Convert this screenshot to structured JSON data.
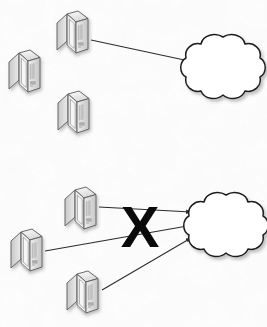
{
  "figure": {
    "name": "network-connectivity-diagram",
    "type": "diagram",
    "width": 267,
    "height": 327,
    "background_color": "#fdfdfd",
    "style": "scanned-paper-grayscale-isometric-clipart"
  },
  "palette": {
    "line": "#2b2b2b",
    "x_mark": "#0a0a0a",
    "node_outline": "#4a4a4a",
    "node_face_light": "#fbfbfb",
    "node_face_mid": "#e8e8e8",
    "node_face_dark": "#cfcfcf",
    "shadow": "#b4b4b4",
    "cloud_fill": "#ffffff",
    "cloud_outline": "#1e1e1e"
  },
  "panels": [
    {
      "id": "top-panel",
      "name": "single-connection-panel",
      "label": "",
      "nodes": [
        {
          "id": "top-server-1",
          "name": "server-node",
          "icon": "server-isometric-icon",
          "label": "",
          "x": 70,
          "y": 36,
          "connected": true
        },
        {
          "id": "top-server-2",
          "name": "server-node",
          "icon": "server-isometric-icon",
          "label": "",
          "x": 22,
          "y": 73,
          "connected": false
        },
        {
          "id": "top-server-3",
          "name": "server-node",
          "icon": "server-isometric-icon",
          "label": "",
          "x": 71,
          "y": 114,
          "connected": false
        }
      ],
      "cloud": {
        "id": "top-cloud",
        "name": "network-cloud",
        "label": "",
        "cx": 223,
        "cy": 66,
        "rx": 39,
        "ry": 35
      },
      "connections": [
        {
          "id": "top-link-1",
          "name": "connection-arrow",
          "from": "top-server-1",
          "to": "top-cloud",
          "x1": 91,
          "y1": 40,
          "x2": 189,
          "y2": 61,
          "arrowhead": true,
          "blocked": false
        }
      ],
      "blocked_marker": null
    },
    {
      "id": "bottom-panel",
      "name": "multi-connection-blocked-panel",
      "label": "",
      "nodes": [
        {
          "id": "bottom-server-1",
          "name": "server-node",
          "icon": "server-isometric-icon",
          "label": "",
          "x": 78,
          "y": 196,
          "connected": true
        },
        {
          "id": "bottom-server-2",
          "name": "server-node",
          "icon": "server-isometric-icon",
          "label": "",
          "x": 24,
          "y": 238,
          "connected": true
        },
        {
          "id": "bottom-server-3",
          "name": "server-node",
          "icon": "server-isometric-icon",
          "label": "",
          "x": 80,
          "y": 280,
          "connected": true
        }
      ],
      "cloud": {
        "id": "bottom-cloud",
        "name": "network-cloud",
        "label": "",
        "cx": 226,
        "cy": 224,
        "rx": 39,
        "ry": 35
      },
      "connections": [
        {
          "id": "bottom-link-1",
          "name": "connection-arrow",
          "from": "bottom-server-1",
          "to": "bottom-cloud",
          "x1": 99,
          "y1": 207,
          "x2": 191,
          "y2": 212,
          "arrowhead": true,
          "blocked": true
        },
        {
          "id": "bottom-link-2",
          "name": "connection-arrow",
          "from": "bottom-server-2",
          "to": "bottom-cloud",
          "x1": 45,
          "y1": 251,
          "x2": 193,
          "y2": 225,
          "arrowhead": true,
          "blocked": true
        },
        {
          "id": "bottom-link-3",
          "name": "connection-arrow",
          "from": "bottom-server-3",
          "to": "bottom-cloud",
          "x1": 102,
          "y1": 290,
          "x2": 191,
          "y2": 238,
          "arrowhead": true,
          "blocked": true
        }
      ],
      "blocked_marker": {
        "id": "blocked-x",
        "name": "blocked-x-mark",
        "text": "X",
        "x": 140,
        "y": 226,
        "font_size": 58,
        "color": "#0a0a0a"
      }
    }
  ]
}
